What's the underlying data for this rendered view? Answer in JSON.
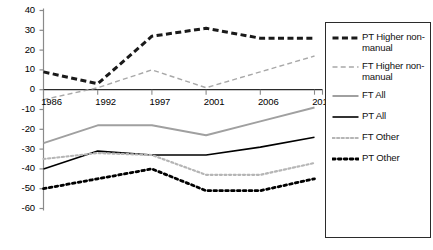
{
  "chart_data": {
    "type": "line",
    "title": "",
    "xlabel": "",
    "ylabel": "",
    "categories": [
      "1986",
      "1992",
      "1997",
      "2001",
      "2006",
      "2012"
    ],
    "ylim": [
      -60,
      40
    ],
    "yticks": [
      40,
      30,
      20,
      10,
      0,
      -10,
      -20,
      -30,
      -40,
      -50,
      -60
    ],
    "grid": false,
    "legend_position": "right",
    "series": [
      {
        "name": "PT Higher non-manual",
        "style": "dashed",
        "color": "#1a1a1a",
        "width": 3,
        "values": [
          9,
          3,
          27,
          31,
          26,
          26
        ]
      },
      {
        "name": "FT Higher non-manual",
        "style": "dashed",
        "color": "#a8a8a8",
        "width": 1.4,
        "values": [
          -5,
          1,
          10,
          1,
          9,
          17
        ]
      },
      {
        "name": "FT All",
        "style": "solid",
        "color": "#a0a0a0",
        "width": 2,
        "values": [
          -27,
          -18,
          -18,
          -23,
          -16,
          -9
        ]
      },
      {
        "name": "PT All",
        "style": "solid",
        "color": "#000000",
        "width": 1.6,
        "values": [
          -40,
          -31,
          -33,
          -33,
          -29,
          -24
        ]
      },
      {
        "name": "FT Other",
        "style": "dotted",
        "color": "#b5b5b5",
        "width": 2.2,
        "values": [
          -35,
          -32,
          -33,
          -43,
          -43,
          -37
        ]
      },
      {
        "name": "PT Other",
        "style": "dotted",
        "color": "#000000",
        "width": 2.8,
        "values": [
          -50,
          -45,
          -40,
          -51,
          -51,
          -45
        ]
      }
    ]
  },
  "legend": {
    "items": [
      {
        "label": "PT Higher non-\nmanual",
        "series": 0
      },
      {
        "label": "FT Higher non-\nmanual",
        "series": 1
      },
      {
        "label": "FT All",
        "series": 2
      },
      {
        "label": "PT All",
        "series": 3
      },
      {
        "label": "FT Other",
        "series": 4
      },
      {
        "label": "PT Other",
        "series": 5
      }
    ]
  },
  "axis": {
    "y_labels": [
      "40",
      "30",
      "20",
      "10",
      "0",
      "-10",
      "-20",
      "-30",
      "-40",
      "-50",
      "-60"
    ],
    "x_labels": [
      "1986",
      "1992",
      "1997",
      "2001",
      "2006",
      "2012"
    ],
    "axis_color": "#8a8a8a",
    "zero_line_color": "#2b2b2b"
  }
}
